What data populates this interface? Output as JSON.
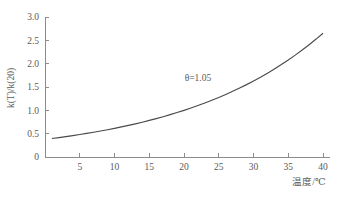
{
  "chart_data": {
    "type": "line",
    "title": "",
    "subtitle": "",
    "xlabel": "温度/℃",
    "ylabel": "k(T)/k(20)",
    "xlim": [
      0,
      41
    ],
    "ylim": [
      0,
      3.0
    ],
    "grid": false,
    "legend": null,
    "xticks": [
      0,
      5,
      10,
      15,
      20,
      25,
      30,
      35,
      40
    ],
    "xticklabels": [
      "0",
      "5",
      "10",
      "15",
      "20",
      "25",
      "30",
      "35",
      "40"
    ],
    "yticks": [
      0,
      0.5,
      1.0,
      1.5,
      2.0,
      2.5,
      3.0
    ],
    "yticklabels": [
      "0",
      "0.5",
      "1.0",
      "1.5",
      "2.0",
      "2.5",
      "3.0"
    ],
    "annotations": [
      {
        "text": "θ=1.05",
        "x": 22.0,
        "y": 1.62
      }
    ],
    "series": [
      {
        "name": "k(T)/k(20)",
        "color": "#4a4a4a",
        "formula": "theta^(T-20), theta=1.05",
        "x": [
          1,
          2,
          3,
          4,
          5,
          6,
          7,
          8,
          9,
          10,
          11,
          12,
          13,
          14,
          15,
          16,
          17,
          18,
          19,
          20,
          21,
          22,
          23,
          24,
          25,
          26,
          27,
          28,
          29,
          30,
          31,
          32,
          33,
          34,
          35,
          36,
          37,
          38,
          39,
          40
        ],
        "values": [
          0.396,
          0.416,
          0.436,
          0.458,
          0.481,
          0.505,
          0.53,
          0.557,
          0.585,
          0.614,
          0.645,
          0.677,
          0.711,
          0.746,
          0.784,
          0.823,
          0.864,
          0.907,
          0.952,
          1.0,
          1.05,
          1.103,
          1.158,
          1.216,
          1.276,
          1.34,
          1.407,
          1.478,
          1.551,
          1.629,
          1.71,
          1.796,
          1.886,
          1.98,
          2.079,
          2.183,
          2.292,
          2.407,
          2.527,
          2.653
        ]
      }
    ],
    "colors": {
      "curve": "#4a4a4a",
      "axis": "#8c8c8c",
      "text": "#5a5a5a",
      "background": "#ffffff"
    }
  }
}
